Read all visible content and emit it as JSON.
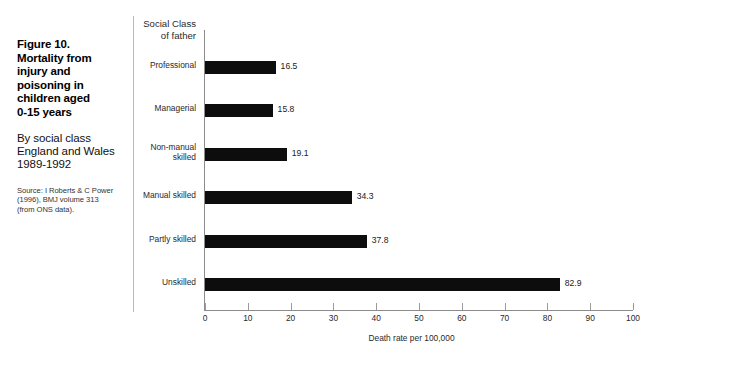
{
  "caption": {
    "title": "Figure 10.\nMortality from\ninjury and\npoisoning in\nchildren aged\n0-15 years",
    "subtitle": "By social class\nEngland and Wales\n1989-1992",
    "source": "Source: I Roberts & C Power\n(1996), BMJ volume 313\n(from ONS data)."
  },
  "chart_data": {
    "type": "bar",
    "orientation": "horizontal",
    "title": "Figure 10. Mortality from injury and poisoning in children aged 0-15 years",
    "subtitle": "By social class England and Wales 1989-1992",
    "categories": [
      "Professional",
      "Managerial",
      "Non-manual\nskilled",
      "Manual skilled",
      "Partly skilled",
      "Unskilled"
    ],
    "values": [
      16.5,
      15.8,
      19.1,
      34.3,
      37.8,
      82.9
    ],
    "value_labels": [
      "16.5",
      "15.8",
      "19.1",
      "34.3",
      "37.8",
      "82.9"
    ],
    "xlabel": "Death rate per 100,000",
    "ylabel": "Social Class\nof father",
    "xlim": [
      0,
      100
    ],
    "xticks": [
      0,
      10,
      20,
      30,
      40,
      50,
      60,
      70,
      80,
      90,
      100
    ],
    "xtick_labels": [
      "0",
      "10",
      "20",
      "30",
      "40",
      "50",
      "60",
      "70",
      "80",
      "90",
      "100"
    ],
    "grid": false,
    "legend": false,
    "bar_color": "#0d0d0d",
    "background_color": "#ffffff"
  }
}
